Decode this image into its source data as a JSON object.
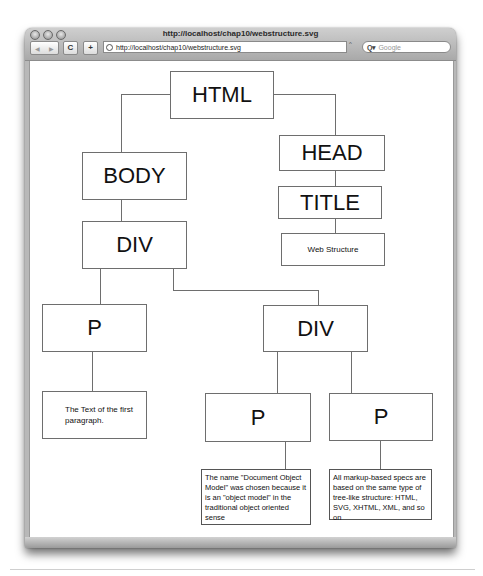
{
  "window": {
    "title": "http://localhost/chap10/webstructure.svg"
  },
  "toolbar": {
    "back_icon": "◀",
    "forward_icon": "▶",
    "reload_icon": "C",
    "add_icon": "+",
    "url": "http://localhost/chap10/webstructure.svg",
    "search_placeholder": "Google",
    "search_icon": "Q▾"
  },
  "diagram": {
    "nodes": {
      "html": "HTML",
      "head": "HEAD",
      "title": "TITLE",
      "title_text": "Web Structure",
      "body": "BODY",
      "div1": "DIV",
      "p1": "P",
      "p1_text": "The Text of the first paragraph.",
      "div2": "DIV",
      "p2": "P",
      "p2_text": "The name \"Document Object Model\" was chosen because it is an \"object model\" in the traditional object oriented sense",
      "p3": "P",
      "p3_text": "All markup-based specs are based on the same type of tree-like structure: HTML, SVG, XHTML, XML, and so on"
    }
  }
}
